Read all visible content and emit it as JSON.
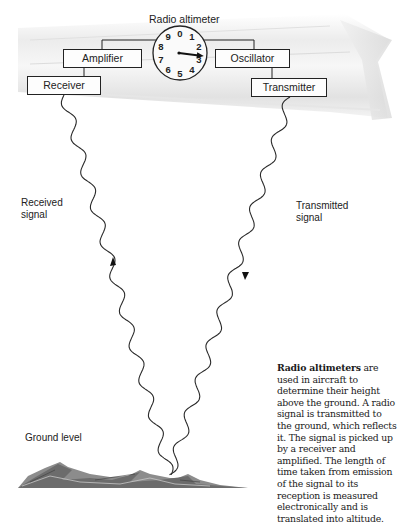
{
  "diagram": {
    "title": "Radio altimeter",
    "boxes": {
      "amplifier": "Amplifier",
      "oscillator": "Oscillator",
      "receiver": "Receiver",
      "transmitter": "Transmitter"
    },
    "dial": {
      "numbers": [
        "0",
        "1",
        "2",
        "3",
        "4",
        "5",
        "6",
        "7",
        "8",
        "9"
      ],
      "pointer_reading": 2.7
    },
    "labels": {
      "received_signal_line1": "Received",
      "received_signal_line2": "signal",
      "transmitted_signal_line1": "Transmitted",
      "transmitted_signal_line2": "signal",
      "ground_level": "Ground level"
    },
    "caption": {
      "bold": "Radio altimeters",
      "text": " are used in aircraft to determine their height above the ground. A radio signal is transmitted to the ground, which reflects it. The signal is picked up by a receiver and amplified. The length of time taken from emission of the signal to its reception is measured electronically and is translated into altitude."
    }
  }
}
